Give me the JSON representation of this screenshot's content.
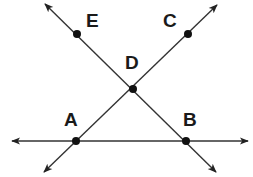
{
  "diagram": {
    "type": "geometry-lines",
    "colors": {
      "line": "#333333",
      "point": "#111111",
      "label": "#1a1a1a",
      "background": "#ffffff"
    },
    "points": [
      {
        "id": "E",
        "label": "E",
        "x": 77,
        "y": 34,
        "label_x": 86,
        "label_y": 27
      },
      {
        "id": "C",
        "label": "C",
        "x": 188,
        "y": 34,
        "label_x": 163,
        "label_y": 27
      },
      {
        "id": "D",
        "label": "D",
        "x": 133,
        "y": 89,
        "label_x": 125,
        "label_y": 69
      },
      {
        "id": "A",
        "label": "A",
        "x": 76,
        "y": 141,
        "label_x": 64,
        "label_y": 126
      },
      {
        "id": "B",
        "label": "B",
        "x": 186,
        "y": 141,
        "label_x": 183,
        "label_y": 126
      }
    ],
    "lines": [
      {
        "id": "line-EB",
        "through": [
          "E",
          "D",
          "B"
        ],
        "x1": 45,
        "y1": 4,
        "x2": 216,
        "y2": 172,
        "arrows": "both"
      },
      {
        "id": "line-AC",
        "through": [
          "A",
          "D",
          "C"
        ],
        "x1": 44,
        "y1": 172,
        "x2": 217,
        "y2": 5,
        "arrows": "both"
      },
      {
        "id": "line-AB",
        "through": [
          "A",
          "B"
        ],
        "x1": 12,
        "y1": 141,
        "x2": 248,
        "y2": 141,
        "arrows": "both"
      }
    ]
  }
}
